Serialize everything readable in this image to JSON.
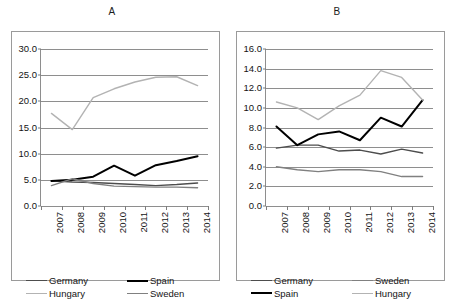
{
  "figure": {
    "background": "#ffffff",
    "colors": {
      "germany": "#4d4d4d",
      "spain": "#000000",
      "hungary": "#b3b3b3",
      "sweden": "#808080",
      "grid": "#8e8e8e",
      "frame": "#9a9a9a",
      "text": "#141414"
    }
  },
  "chart_data": [
    {
      "type": "line",
      "panel": "A",
      "title": "A",
      "xlabel": "",
      "ylabel": "",
      "x": [
        "2007",
        "2008",
        "2009",
        "2010",
        "2011",
        "2012",
        "2013",
        "2014"
      ],
      "categories": [
        "2007",
        "2008",
        "2009",
        "2010",
        "2011",
        "2012",
        "2013",
        "2014"
      ],
      "ylim": [
        0.0,
        30.0
      ],
      "yticks": [
        "0.0",
        "5.0",
        "10.0",
        "15.0",
        "20.0",
        "25.0",
        "30.0"
      ],
      "ytick_values": [
        0.0,
        5.0,
        10.0,
        15.0,
        20.0,
        25.0,
        30.0
      ],
      "grid": true,
      "legend_position": "below",
      "series": [
        {
          "name": "Germany",
          "color": "#4d4d4d",
          "width": 1.4,
          "values": [
            4.8,
            4.6,
            4.5,
            4.3,
            4.1,
            3.9,
            4.1,
            4.4
          ]
        },
        {
          "name": "Spain",
          "color": "#000000",
          "width": 2.0,
          "values": [
            4.8,
            5.0,
            5.6,
            7.7,
            5.8,
            7.8,
            8.6,
            9.5
          ]
        },
        {
          "name": "Hungary",
          "color": "#b3b3b3",
          "width": 1.4,
          "values": [
            17.7,
            14.6,
            20.7,
            22.4,
            23.7,
            24.6,
            24.7,
            23.0
          ]
        },
        {
          "name": "Sweden",
          "color": "#808080",
          "width": 1.4,
          "values": [
            3.9,
            5.2,
            4.3,
            3.8,
            3.7,
            3.6,
            3.6,
            3.5
          ]
        }
      ],
      "legend": [
        {
          "label": "Germany",
          "color": "#4d4d4d",
          "width": 1.4
        },
        {
          "label": "Spain",
          "color": "#000000",
          "width": 2.0
        },
        {
          "label": "Hungary",
          "color": "#b3b3b3",
          "width": 1.4
        },
        {
          "label": "Sweden",
          "color": "#808080",
          "width": 1.4
        }
      ]
    },
    {
      "type": "line",
      "panel": "B",
      "title": "B",
      "xlabel": "",
      "ylabel": "",
      "x": [
        "2007",
        "2008",
        "2009",
        "2010",
        "2011",
        "2012",
        "2013",
        "2014"
      ],
      "categories": [
        "2007",
        "2008",
        "2009",
        "2010",
        "2011",
        "2012",
        "2013",
        "2014"
      ],
      "ylim": [
        0.0,
        16.0
      ],
      "yticks": [
        "0.0",
        "2.0",
        "4.0",
        "6.0",
        "8.0",
        "10.0",
        "12.0",
        "14.0",
        "16.0"
      ],
      "ytick_values": [
        0.0,
        2.0,
        4.0,
        6.0,
        8.0,
        10.0,
        12.0,
        14.0,
        16.0
      ],
      "grid": true,
      "legend_position": "below",
      "series": [
        {
          "name": "Germany",
          "color": "#4d4d4d",
          "width": 1.4,
          "values": [
            5.9,
            6.2,
            6.2,
            5.6,
            5.7,
            5.3,
            5.8,
            5.4
          ]
        },
        {
          "name": "Sweden",
          "color": "#808080",
          "width": 1.4,
          "values": [
            4.0,
            3.7,
            3.5,
            3.7,
            3.7,
            3.5,
            3.0,
            3.0
          ]
        },
        {
          "name": "Spain",
          "color": "#000000",
          "width": 2.0,
          "values": [
            8.1,
            6.2,
            7.3,
            7.6,
            6.7,
            9.0,
            8.1,
            10.8
          ]
        },
        {
          "name": "Hungary",
          "color": "#b3b3b3",
          "width": 1.4,
          "values": [
            10.6,
            10.0,
            8.8,
            10.2,
            11.3,
            13.8,
            13.1,
            10.8
          ]
        }
      ],
      "legend": [
        {
          "label": "Germany",
          "color": "#4d4d4d",
          "width": 1.4
        },
        {
          "label": "Sweden",
          "color": "#808080",
          "width": 1.4
        },
        {
          "label": "Spain",
          "color": "#000000",
          "width": 2.0
        },
        {
          "label": "Hungary",
          "color": "#b3b3b3",
          "width": 1.4
        }
      ]
    }
  ]
}
